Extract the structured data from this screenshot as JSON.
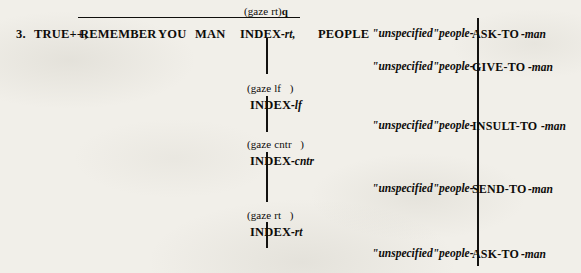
{
  "example": {
    "number": "3.",
    "main_line": {
      "glosses": [
        {
          "text": "TRUE++,",
          "x": 34,
          "y": 28
        },
        {
          "text": "REMEMBER",
          "x": 80,
          "y": 28
        },
        {
          "text": "YOU",
          "x": 158,
          "y": 28
        },
        {
          "text": "MAN",
          "x": 195,
          "y": 28
        },
        {
          "text": "INDEX",
          "x": 240,
          "y": 28
        },
        {
          "text": "PEOPLE",
          "x": 318,
          "y": 28
        }
      ],
      "index_locus": "-rt,",
      "nonmanual_marker": "(gaze rt)",
      "nonmanual_suffix": "q",
      "overline": {
        "x": 78,
        "y": 17,
        "width": 222
      }
    },
    "gaze_blocks": [
      {
        "marker": "(gaze lf   )",
        "gloss": "INDEX",
        "locus": "-lf",
        "x": 247,
        "y": 83
      },
      {
        "marker": "(gaze cntr   )",
        "gloss": "INDEX",
        "locus": "-cntr",
        "x": 247,
        "y": 139
      },
      {
        "marker": "(gaze rt   )",
        "gloss": "INDEX",
        "locus": "-rt",
        "x": 247,
        "y": 210
      }
    ],
    "agreement_verbs": [
      {
        "role": "\"unspecified\"people-",
        "verb": "ASK-TO",
        "object": "-man",
        "x": 372,
        "y": 28
      },
      {
        "role": "\"unspecified\"people-",
        "verb": "GIVE-TO",
        "object": "-man",
        "x": 372,
        "y": 61
      },
      {
        "role": "\"unspecified\"people-",
        "verb": "INSULT-TO",
        "object": "-man",
        "x": 372,
        "y": 120
      },
      {
        "role": "\"unspecified\"people-",
        "verb": "SEND-TO",
        "object": "-man",
        "x": 372,
        "y": 183
      },
      {
        "role": "\"unspecified\"people-",
        "verb": "ASK-TO",
        "object": "-man",
        "x": 372,
        "y": 248
      }
    ],
    "connector_lines": {
      "center_segments": [
        {
          "x": 266,
          "y": 38,
          "height": 36
        },
        {
          "x": 266,
          "y": 96,
          "height": 36
        },
        {
          "x": 266,
          "y": 152,
          "height": 50
        },
        {
          "x": 266,
          "y": 222,
          "height": 26
        }
      ],
      "right_spine": {
        "x": 477,
        "y": 18,
        "height": 248
      }
    },
    "colors": {
      "ink": "#100f0c",
      "paper": "#f1efe9"
    }
  }
}
